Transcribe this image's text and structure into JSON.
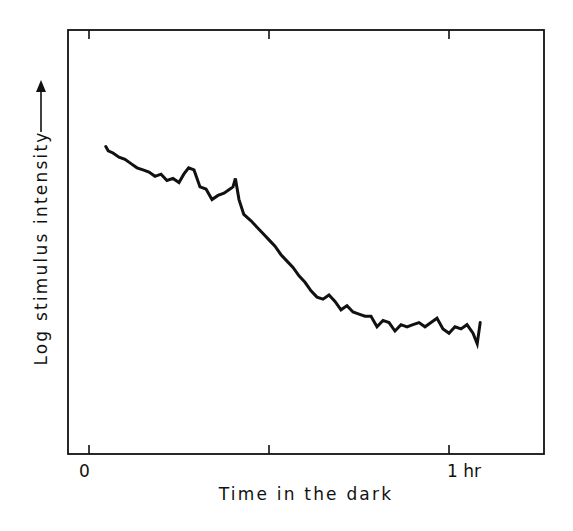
{
  "chart_data": {
    "type": "line",
    "title": "",
    "xlabel": "Time in the dark",
    "ylabel": "Log stimulus intensity",
    "ylabel_arrow": "up-arrow",
    "x_unit": "minutes",
    "x_ticks": [
      {
        "value": 0,
        "label": "0"
      },
      {
        "value": 30,
        "label": ""
      },
      {
        "value": 60,
        "label": "1 hr"
      }
    ],
    "xlim": [
      -3.5,
      76
    ],
    "y_ticks": [],
    "ylim": [
      0,
      1
    ],
    "grid": false,
    "legend": null,
    "series": [
      {
        "name": "dark adaptation threshold",
        "color": "#111111",
        "x": [
          2.8,
          3.2,
          4.0,
          5.0,
          6.0,
          7.0,
          8.0,
          9.0,
          10.0,
          11.0,
          12.0,
          13.0,
          14.0,
          15.0,
          15.8,
          16.6,
          17.5,
          18.5,
          19.5,
          20.5,
          21.5,
          22.5,
          23.5,
          24.0,
          24.4,
          25.0,
          25.8,
          27.0,
          28.0,
          29.0,
          30.0,
          31.0,
          32.0,
          33.0,
          34.0,
          35.0,
          36.0,
          37.0,
          38.0,
          39.0,
          40.0,
          41.0,
          42.0,
          43.0,
          44.0,
          45.0,
          46.0,
          47.0,
          48.0,
          49.0,
          50.0,
          51.0,
          52.0,
          53.0,
          54.0,
          55.0,
          56.0,
          57.0,
          58.0,
          59.0,
          60.0,
          61.0,
          62.0,
          63.0,
          64.0,
          64.7,
          65.2
        ],
        "y": [
          0.725,
          0.715,
          0.71,
          0.7,
          0.695,
          0.685,
          0.675,
          0.67,
          0.665,
          0.655,
          0.66,
          0.645,
          0.65,
          0.64,
          0.66,
          0.675,
          0.67,
          0.63,
          0.625,
          0.6,
          0.61,
          0.615,
          0.625,
          0.63,
          0.65,
          0.6,
          0.565,
          0.55,
          0.535,
          0.52,
          0.505,
          0.49,
          0.47,
          0.455,
          0.44,
          0.42,
          0.405,
          0.385,
          0.37,
          0.365,
          0.375,
          0.36,
          0.34,
          0.35,
          0.335,
          0.33,
          0.325,
          0.325,
          0.3,
          0.315,
          0.31,
          0.29,
          0.305,
          0.3,
          0.305,
          0.31,
          0.3,
          0.31,
          0.32,
          0.295,
          0.285,
          0.3,
          0.295,
          0.305,
          0.285,
          0.26,
          0.31
        ]
      }
    ],
    "annotations": []
  },
  "ui": {
    "x_axis_title": "Time in the dark",
    "y_axis_title": "Log stimulus intensity",
    "y_axis_arrow": "→"
  }
}
